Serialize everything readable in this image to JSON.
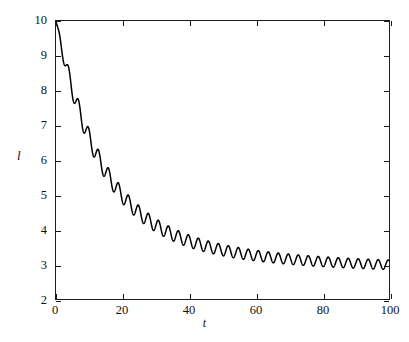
{
  "figure": {
    "background_color": "#ffffff",
    "axis_color": "#1a1a1a",
    "curve_color": "#000000"
  },
  "axes": {
    "xlabel": "t",
    "ylabel": "l",
    "x_ticks": [
      0,
      20,
      40,
      60,
      80,
      100
    ],
    "y_ticks": [
      2,
      3,
      4,
      5,
      6,
      7,
      8,
      9,
      10
    ]
  },
  "caption": {
    "text": ""
  },
  "chart_data": {
    "type": "line",
    "title": "",
    "subtitle": "",
    "xlabel": "t",
    "ylabel": "l",
    "xlim": [
      0,
      100
    ],
    "ylim": [
      2,
      10
    ],
    "xticks": [
      0,
      20,
      40,
      60,
      80,
      100
    ],
    "yticks": [
      2,
      3,
      4,
      5,
      6,
      7,
      8,
      9,
      10
    ],
    "grid": false,
    "legend": null,
    "legend_position": "none",
    "annotations": [],
    "model": {
      "baseline_start": 10.0,
      "baseline_final": 2.85,
      "decay_time_constant": 13.0,
      "secondary_decay_time_constant": 42.0,
      "ripple_period": 3.0,
      "ripple_amplitude_start": 0.3,
      "ripple_amplitude_final": 0.13,
      "ripple_decay_time_constant": 30.0
    },
    "series": [
      {
        "name": "l(t)",
        "color": "#000000",
        "line_width": 1.5,
        "x": [
          0,
          2,
          4,
          6,
          8,
          10,
          12,
          14,
          16,
          18,
          20,
          22,
          24,
          26,
          28,
          30,
          32,
          34,
          36,
          38,
          40,
          42,
          44,
          46,
          48,
          50,
          52,
          54,
          56,
          58,
          60,
          62,
          64,
          66,
          68,
          70,
          72,
          74,
          76,
          78,
          80,
          82,
          84,
          86,
          88,
          90,
          92,
          94,
          96,
          98,
          100
        ],
        "values": [
          10.0,
          9.1,
          8.3,
          7.45,
          6.7,
          6.05,
          5.45,
          5.0,
          4.6,
          4.3,
          4.05,
          3.82,
          3.65,
          3.5,
          3.4,
          3.3,
          3.22,
          3.15,
          3.1,
          3.06,
          3.03,
          3.0,
          2.98,
          2.96,
          2.95,
          2.94,
          2.93,
          2.92,
          2.91,
          2.9,
          2.9,
          2.89,
          2.89,
          2.88,
          2.88,
          2.88,
          2.87,
          2.87,
          2.87,
          2.87,
          2.86,
          2.86,
          2.86,
          2.86,
          2.86,
          2.86,
          2.85,
          2.85,
          2.85,
          2.85,
          2.85
        ]
      }
    ]
  }
}
